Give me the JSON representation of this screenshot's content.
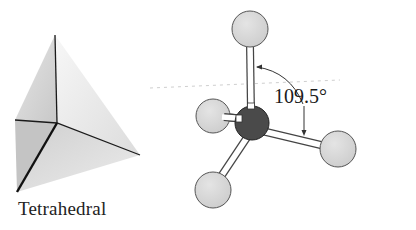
{
  "figure": {
    "left_panel": {
      "shape": "tetrahedron-solid",
      "caption": "Tetrahedral"
    },
    "right_panel": {
      "model": "ball-and-stick",
      "central_atom_color": "#4a4a4a",
      "outer_atom_color": "#d6d6d6",
      "outer_atom_count": 4,
      "bond_angle_label": "109.5°"
    }
  },
  "colors": {
    "background": "#ffffff",
    "edge": "#1a1a1a",
    "face_light": "#f2f2f2",
    "face_mid": "#d9d9d9",
    "face_dark": "#bdbdbd"
  }
}
